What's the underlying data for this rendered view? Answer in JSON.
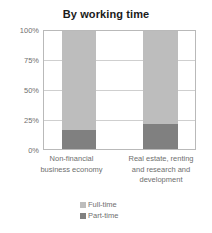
{
  "chart_data": {
    "type": "bar",
    "title": "By working time",
    "xlabel": "",
    "ylabel": "",
    "ylim": [
      0,
      100
    ],
    "grid": true,
    "stacked": true,
    "stacked_percent": true,
    "legend_position": "bottom",
    "categories": [
      "Non-financial business economy",
      "Real estate, renting and research and development"
    ],
    "tick_labels": [
      "0%",
      "25%",
      "50%",
      "75%",
      "100%"
    ],
    "tick_values": [
      0,
      25,
      50,
      75,
      100
    ],
    "series": [
      {
        "name": "Full-time",
        "color": "#bdbdbd",
        "values": [
          84,
          79
        ]
      },
      {
        "name": "Part-time",
        "color": "#808080",
        "values": [
          16,
          21
        ]
      }
    ]
  },
  "axis": {
    "ticks": [
      {
        "label": "100%",
        "value": 100
      },
      {
        "label": "75%",
        "value": 75
      },
      {
        "label": "50%",
        "value": 50
      },
      {
        "label": "25%",
        "value": 25
      },
      {
        "label": "0%",
        "value": 0
      }
    ]
  },
  "categories": [
    {
      "lines": [
        "Non-financial",
        "business economy"
      ]
    },
    {
      "lines": [
        "Real estate, renting",
        "and research and",
        "development"
      ]
    }
  ],
  "legend": {
    "items": [
      {
        "label": "Full-time",
        "color": "#bdbdbd"
      },
      {
        "label": "Part-time",
        "color": "#808080"
      }
    ]
  }
}
